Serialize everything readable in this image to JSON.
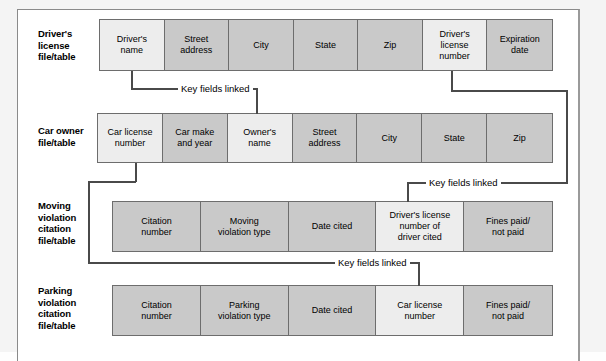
{
  "diagram": {
    "link_label": "Key fields linked",
    "colors": {
      "cell_fill": "#c9c9c9",
      "key_cell_fill": "#ededed",
      "cell_border": "#6d6d6d",
      "connector": "#4a4a4a"
    },
    "rows": [
      {
        "id": "drivers-license",
        "label": "Driver's\nlicense\nfile/table",
        "cells": [
          {
            "text": "Driver's\nname",
            "key": true
          },
          {
            "text": "Street\naddress",
            "key": false
          },
          {
            "text": "City",
            "key": false
          },
          {
            "text": "State",
            "key": false
          },
          {
            "text": "Zip",
            "key": false
          },
          {
            "text": "Driver's\nlicense\nnumber",
            "key": true
          },
          {
            "text": "Expiration\ndate",
            "key": false
          }
        ]
      },
      {
        "id": "car-owner",
        "label": "Car owner\nfile/table",
        "cells": [
          {
            "text": "Car license\nnumber",
            "key": true
          },
          {
            "text": "Car make\nand year",
            "key": false
          },
          {
            "text": "Owner's\nname",
            "key": true
          },
          {
            "text": "Street\naddress",
            "key": false
          },
          {
            "text": "City",
            "key": false
          },
          {
            "text": "State",
            "key": false
          },
          {
            "text": "Zip",
            "key": false
          }
        ]
      },
      {
        "id": "moving-violation",
        "label": "Moving\nviolation\ncitation\nfile/table",
        "cells": [
          {
            "text": "Citation\nnumber",
            "key": false
          },
          {
            "text": "Moving\nviolation type",
            "key": false
          },
          {
            "text": "Date cited",
            "key": false
          },
          {
            "text": "Driver's license\nnumber of\ndriver cited",
            "key": true
          },
          {
            "text": "Fines paid/\nnot paid",
            "key": false
          }
        ]
      },
      {
        "id": "parking-violation",
        "label": "Parking\nviolation\ncitation\nfile/table",
        "cells": [
          {
            "text": "Citation\nnumber",
            "key": false
          },
          {
            "text": "Parking\nviolation type",
            "key": false
          },
          {
            "text": "Date cited",
            "key": false
          },
          {
            "text": "Car license\nnumber",
            "key": true
          },
          {
            "text": "Fines paid/\nnot paid",
            "key": false
          }
        ]
      }
    ],
    "links": [
      {
        "id": "drivers-name-to-owners-name",
        "label": "Key fields linked"
      },
      {
        "id": "license-number-to-moving-citation",
        "label": "Key fields linked"
      },
      {
        "id": "car-license-to-parking-citation",
        "label": "Key fields linked"
      }
    ]
  }
}
